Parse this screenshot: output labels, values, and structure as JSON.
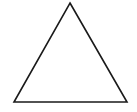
{
  "diagram": {
    "background": "#ffffff",
    "shapes": [
      {
        "type": "triangle",
        "kind": "equilateral-outline",
        "points": [
          [
            70,
            3
          ],
          [
            127,
            102
          ],
          [
            14,
            102
          ]
        ],
        "stroke": "#1a1a1a",
        "stroke_width": 1.6,
        "fill": "none"
      }
    ]
  }
}
